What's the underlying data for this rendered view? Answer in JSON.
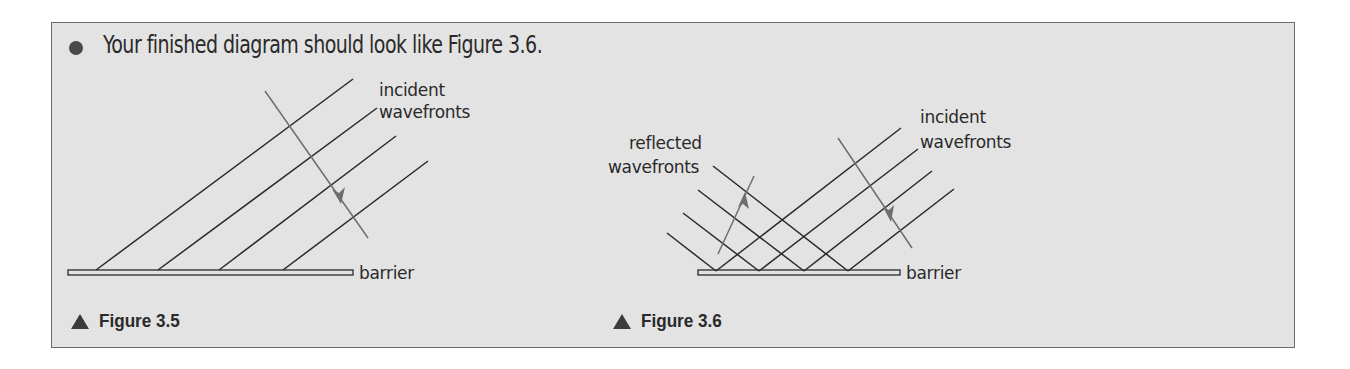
{
  "instruction": {
    "bullet_icon": "bullet-dot",
    "text": "Your finished diagram should look like Figure 3.6."
  },
  "figure_3_5": {
    "caption": "Figure 3.5",
    "caption_icon": "triangle-up",
    "labels": {
      "incident_line1": "incident",
      "incident_line2": "wavefronts",
      "barrier": "barrier"
    },
    "wavefront_count": 4,
    "arrows": [
      "incident direction (down-right)"
    ]
  },
  "figure_3_6": {
    "caption": "Figure 3.6",
    "caption_icon": "triangle-up",
    "labels": {
      "reflected_line1": "reflected",
      "reflected_line2": "wavefronts",
      "incident_line1": "incident",
      "incident_line2": "wavefronts",
      "barrier": "barrier"
    },
    "incident_wavefront_count": 4,
    "reflected_wavefront_count": 4,
    "arrows": [
      "incident direction (down-right)",
      "reflected direction (up-right)"
    ]
  },
  "colors": {
    "panel_background": "#e3e3e3",
    "panel_border": "#6a6a6a",
    "line": "#2a2a2a",
    "arrow": "#6e6e6e",
    "text": "#2a2a2a"
  }
}
